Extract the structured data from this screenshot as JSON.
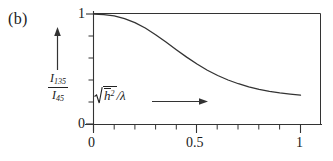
{
  "figure": {
    "panel_label": "(b)",
    "background_color": "#ffffff",
    "line_color": "#222222"
  },
  "axes": {
    "y_label_numerator": "I",
    "y_label_numerator_sub": "135",
    "y_label_denominator": "I",
    "y_label_denominator_sub": "45",
    "y_label_plain": "I_135 / I_45",
    "x_label_radicand": "h",
    "x_label_exponent": "2",
    "x_label_divisor": "/λ",
    "x_label_plain": "sqrt(h̄²)/λ",
    "y_ticks": [
      "0",
      "1"
    ],
    "x_ticks": [
      "0",
      "0.5",
      "1"
    ]
  },
  "chart_data": {
    "type": "line",
    "title": "",
    "xlabel": "sqrt(mean h squared) / lambda",
    "ylabel": "I_135 / I_45",
    "xlim": [
      0,
      1.1
    ],
    "ylim": [
      0,
      1.05
    ],
    "xticks": [
      0,
      0.5,
      1
    ],
    "xtick_labels": [
      "0",
      "0.5",
      "1"
    ],
    "xminor_step": 0.1,
    "yticks": [
      0,
      1
    ],
    "ytick_labels": [
      "0",
      "1"
    ],
    "yminor_step": 0.2,
    "grid": false,
    "legend": null,
    "series": [
      {
        "name": "I135/I45 ratio",
        "x": [
          0.0,
          0.05,
          0.1,
          0.15,
          0.2,
          0.25,
          0.3,
          0.35,
          0.4,
          0.45,
          0.5,
          0.55,
          0.6,
          0.65,
          0.7,
          0.75,
          0.8,
          0.85,
          0.9,
          0.95,
          1.0
        ],
        "y": [
          1.0,
          0.995,
          0.982,
          0.958,
          0.922,
          0.873,
          0.812,
          0.745,
          0.675,
          0.608,
          0.545,
          0.489,
          0.441,
          0.4,
          0.366,
          0.338,
          0.315,
          0.297,
          0.283,
          0.272,
          0.263
        ]
      }
    ],
    "annotations": [
      {
        "name": "y-axis-direction-arrow",
        "direction": "up",
        "description": "vertical arrow above y-axis label"
      },
      {
        "name": "x-axis-direction-arrow",
        "direction": "right",
        "description": "horizontal arrow right of x-axis label"
      }
    ]
  }
}
